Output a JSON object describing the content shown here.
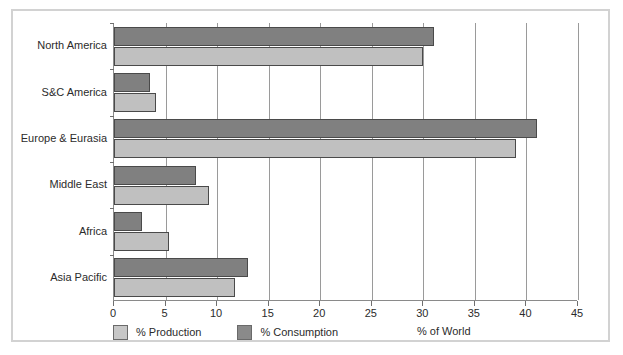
{
  "chart_data": {
    "type": "bar",
    "orientation": "horizontal",
    "title": "",
    "xlabel": "% of World",
    "ylabel": "",
    "xlim": [
      0,
      45
    ],
    "xticks": [
      0,
      5,
      10,
      15,
      20,
      25,
      30,
      35,
      40,
      45
    ],
    "grid": true,
    "legend_position": "bottom-left",
    "categories": [
      "North America",
      "S&C America",
      "Europe & Eurasia",
      "Middle East",
      "Africa",
      "Asia Pacific"
    ],
    "series": [
      {
        "name": "% Production",
        "color": "#c0c0c0",
        "values": [
          30.0,
          4.1,
          39.0,
          9.2,
          5.3,
          11.7
        ]
      },
      {
        "name": "% Consumption",
        "color": "#808080",
        "values": [
          31.0,
          3.5,
          41.0,
          8.0,
          2.7,
          13.0
        ]
      }
    ]
  },
  "legend": {
    "items": [
      {
        "label": "% Production",
        "swatch": "production"
      },
      {
        "label": "% Consumption",
        "swatch": "consumption"
      }
    ]
  },
  "axis": {
    "x_title": "% of World"
  },
  "colors": {
    "production": "#c0c0c0",
    "consumption": "#808080",
    "frame": "#d2d2d2",
    "gridline": "#9a9a9a",
    "text": "#2b2b2b"
  }
}
